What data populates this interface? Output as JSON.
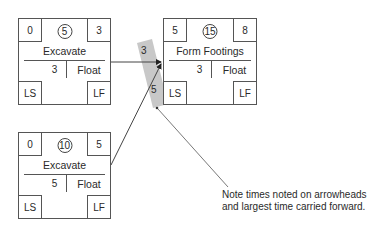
{
  "nodes": [
    {
      "id": "excavate-a",
      "es": "0",
      "duration": "5",
      "ef": "3",
      "name": "Excavate",
      "float_value": "3",
      "float_label": "Float",
      "ls": "LS",
      "lf": "LF"
    },
    {
      "id": "form-footings",
      "es": "5",
      "duration": "15",
      "ef": "8",
      "name": "Form Footings",
      "float_value": "3",
      "float_label": "Float",
      "ls": "LS",
      "lf": "LF"
    },
    {
      "id": "excavate-b",
      "es": "0",
      "duration": "10",
      "ef": "5",
      "name": "Excavate",
      "float_value": "5",
      "float_label": "Float",
      "ls": "LS",
      "lf": "LF"
    }
  ],
  "arrow_labels": {
    "top": "3",
    "bottom": "5"
  },
  "note": {
    "line1": "Note times noted on arrowheads",
    "line2": "and largest time carried forward."
  },
  "colors": {
    "line": "#555555",
    "highlight": "#c8c8c8",
    "text": "#2a2a2a"
  }
}
